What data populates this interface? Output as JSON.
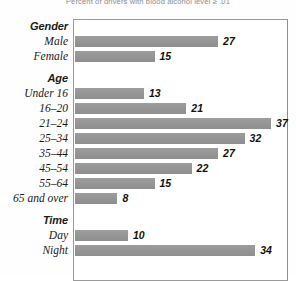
{
  "chart_data": {
    "type": "bar",
    "title": "Percent of drivers with blood alcohol level ≥ .01",
    "orientation": "horizontal",
    "xlabel": "",
    "ylabel": "",
    "xlim": [
      0,
      40
    ],
    "grid": false,
    "legend": null,
    "value_suffix": "",
    "groups": [
      {
        "name": "Gender",
        "categories": [
          "Male",
          "Female"
        ],
        "values": [
          27,
          15
        ]
      },
      {
        "name": "Age",
        "categories": [
          "Under 16",
          "16–20",
          "21–24",
          "25–34",
          "35–44",
          "45–54",
          "55–64",
          "65 and over"
        ],
        "values": [
          13,
          21,
          37,
          32,
          27,
          22,
          15,
          8
        ]
      },
      {
        "name": "Time",
        "categories": [
          "Day",
          "Night"
        ],
        "values": [
          10,
          34
        ]
      }
    ],
    "categories": [
      "Male",
      "Female",
      "Under 16",
      "16–20",
      "21–24",
      "25–34",
      "35–44",
      "45–54",
      "55–64",
      "65 and over",
      "Day",
      "Night"
    ],
    "values": [
      27,
      15,
      13,
      21,
      37,
      32,
      27,
      22,
      15,
      8,
      10,
      34
    ]
  },
  "colors": {
    "bar": "#979797",
    "frame": "#9a9a9a",
    "text": "#1a1a1a",
    "title": "#8d8d8d",
    "background": "#ffffff"
  }
}
